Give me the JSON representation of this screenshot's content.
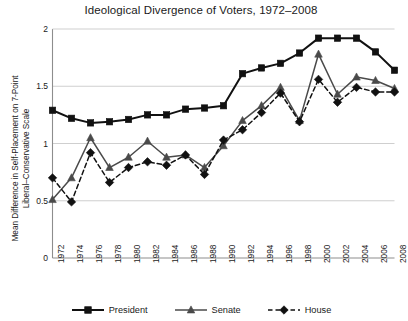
{
  "chart_data": {
    "type": "line",
    "title": "Ideological Divergence of Voters, 1972–2008",
    "xlabel": "",
    "ylabel": "Mean Difference in Self-Placement on 7-Point Liberal–Conservative Scale",
    "ylabel_line1": "Mean Difference in Self-Placement on 7-Point",
    "ylabel_line2": "Liberal–Conservative Scale",
    "categories": [
      "1972",
      "1974",
      "1976",
      "1978",
      "1980",
      "1982",
      "1984",
      "1986",
      "1988",
      "1990",
      "1992",
      "1994",
      "1996",
      "1998",
      "2000",
      "2002",
      "2004",
      "2006",
      "2008"
    ],
    "ylim": [
      0,
      2
    ],
    "yticks": [
      "0",
      "0.5",
      "1",
      "1.5",
      "2"
    ],
    "ytick_values": [
      0,
      0.5,
      1,
      1.5,
      2
    ],
    "grid": "horizontal",
    "legend_position": "bottom",
    "series": [
      {
        "name": "President",
        "marker": "square",
        "linestyle": "solid",
        "color": "#111111",
        "values": [
          1.29,
          1.22,
          1.18,
          1.19,
          1.21,
          1.25,
          1.25,
          1.3,
          1.31,
          1.33,
          1.61,
          1.66,
          1.7,
          1.79,
          1.92,
          1.92,
          1.92,
          1.8,
          1.64
        ]
      },
      {
        "name": "Senate",
        "marker": "triangle",
        "linestyle": "solid",
        "color": "#4a4a4a",
        "values": [
          0.51,
          0.7,
          1.05,
          0.79,
          0.88,
          1.02,
          0.88,
          0.9,
          0.79,
          0.98,
          1.2,
          1.33,
          1.49,
          1.2,
          1.78,
          1.43,
          1.58,
          1.55,
          1.48
        ]
      },
      {
        "name": "House",
        "marker": "diamond",
        "linestyle": "dashed",
        "color": "#111111",
        "values": [
          0.7,
          0.49,
          0.92,
          0.66,
          0.79,
          0.84,
          0.81,
          0.9,
          0.73,
          1.03,
          1.12,
          1.27,
          1.44,
          1.19,
          1.56,
          1.36,
          1.49,
          1.45,
          1.45
        ]
      }
    ]
  },
  "legend": {
    "items": [
      {
        "label": "President"
      },
      {
        "label": "Senate"
      },
      {
        "label": "House"
      }
    ]
  }
}
